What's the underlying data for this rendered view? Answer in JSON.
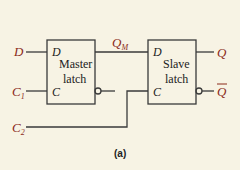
{
  "figure": {
    "caption": "(a)",
    "inputs": {
      "d": "D",
      "c1": "C",
      "c1_sub": "1",
      "c2": "C",
      "c2_sub": "2"
    },
    "master": {
      "line1": "Master",
      "line2": "latch",
      "pin_d": "D",
      "pin_c": "C"
    },
    "slave": {
      "line1": "Slave",
      "line2": "latch",
      "pin_d": "D",
      "pin_c": "C"
    },
    "qm": {
      "label": "Q",
      "sub": "M"
    },
    "outputs": {
      "q": "Q",
      "qbar": "Q"
    },
    "colors": {
      "label": "#8b2a1a",
      "line": "#3a3a3a",
      "background": "#f7f3e4"
    }
  }
}
